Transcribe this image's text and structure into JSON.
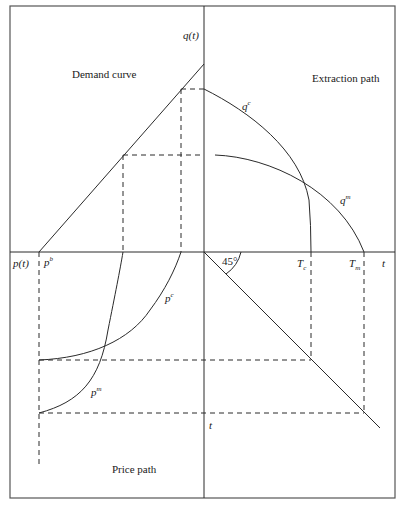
{
  "diagram": {
    "quadrants": {
      "top_left_title": "Demand curve",
      "top_right_title": "Extraction path",
      "bottom_left_title": "Price path"
    },
    "axes": {
      "vertical_top_label": "q(t)",
      "horizontal_left_label": "p(t)",
      "horizontal_right_label": "t",
      "vertical_bottom_label": "t"
    },
    "curve_labels": {
      "qc_base": "q",
      "qc_sup": "c",
      "qm_base": "q",
      "qm_sup": "m",
      "pc_base": "p",
      "pc_sup": "c",
      "pm_base": "p",
      "pm_sup": "m",
      "pb_base": "p",
      "pb_sup": "b"
    },
    "markers": {
      "tc_base": "T",
      "tc_sub": "c",
      "tm_base": "T",
      "tm_sub": "m",
      "angle": "45°"
    },
    "colors": {
      "line": "#2a2a2a",
      "frame": "#555555",
      "background": "#ffffff"
    }
  }
}
